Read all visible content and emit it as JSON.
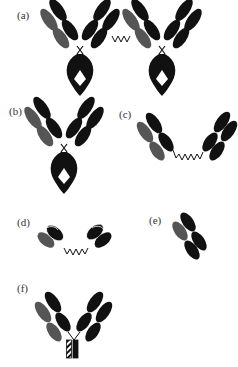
{
  "figure": {
    "panels": [
      {
        "label": "(a)",
        "description": "two IgG antibodies joined by a linker (dimer)"
      },
      {
        "label": "(b)",
        "description": "IgG antibody"
      },
      {
        "label": "(c)",
        "description": "two Fab fragments joined by a linker"
      },
      {
        "label": "(d)",
        "description": "two scFv fragments joined by a linker"
      },
      {
        "label": "(e)",
        "description": "Fab fragment"
      },
      {
        "label": "(f)",
        "description": "antibody with modified (hatched) Fc region"
      }
    ]
  },
  "colors": {
    "heavy_chain": "#111111",
    "light_chain": "#555555",
    "background": "#ffffff"
  }
}
